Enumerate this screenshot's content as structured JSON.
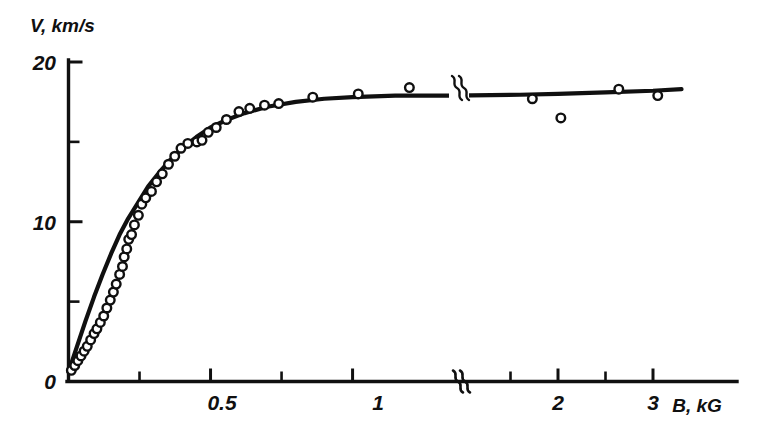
{
  "chart_data": {
    "type": "scatter",
    "title": "",
    "subtitle": "",
    "xlabel": "B, kG",
    "ylabel": "V, km/s",
    "xlabel_parts": {
      "symbol": "B",
      "unit": "kG"
    },
    "ylabel_parts": {
      "symbol": "V",
      "unit": "km/s"
    },
    "xlim": [
      0,
      3.35
    ],
    "ylim": [
      0,
      20.6
    ],
    "grid": false,
    "legend": null,
    "axis_break": {
      "present": true,
      "axis": "x",
      "at_value": 1.35,
      "symbol": "double-squiggle",
      "note": "x axis scale compresses after the break"
    },
    "x_ticks_major": [
      {
        "value": 0,
        "label": "0"
      },
      {
        "value": 0.5,
        "label": "0.5"
      },
      {
        "value": 1,
        "label": "1"
      },
      {
        "value": 2,
        "label": "2"
      },
      {
        "value": 3,
        "label": "3"
      }
    ],
    "x_ticks_minor": [
      0.25,
      0.75,
      1.5,
      2.5
    ],
    "y_ticks_major": [
      {
        "value": 0,
        "label": "0"
      },
      {
        "value": 10,
        "label": "10"
      },
      {
        "value": 20,
        "label": "20"
      }
    ],
    "y_ticks_minor": [
      5,
      15
    ],
    "series": [
      {
        "name": "measured points",
        "type": "scatter",
        "marker": "open-circle",
        "color": "#101010",
        "points": [
          [
            0.01,
            0.7
          ],
          [
            0.022,
            1.0
          ],
          [
            0.033,
            1.3
          ],
          [
            0.044,
            1.6
          ],
          [
            0.055,
            1.9
          ],
          [
            0.066,
            2.2
          ],
          [
            0.078,
            2.6
          ],
          [
            0.09,
            3.0
          ],
          [
            0.1,
            3.3
          ],
          [
            0.112,
            3.7
          ],
          [
            0.124,
            4.1
          ],
          [
            0.135,
            4.6
          ],
          [
            0.147,
            5.1
          ],
          [
            0.158,
            5.6
          ],
          [
            0.168,
            6.1
          ],
          [
            0.18,
            6.7
          ],
          [
            0.19,
            7.2
          ],
          [
            0.196,
            7.8
          ],
          [
            0.205,
            8.3
          ],
          [
            0.212,
            8.9
          ],
          [
            0.222,
            9.2
          ],
          [
            0.232,
            9.8
          ],
          [
            0.246,
            10.4
          ],
          [
            0.258,
            11.1
          ],
          [
            0.272,
            11.5
          ],
          [
            0.292,
            11.9
          ],
          [
            0.31,
            12.5
          ],
          [
            0.33,
            13.0
          ],
          [
            0.352,
            13.6
          ],
          [
            0.374,
            14.1
          ],
          [
            0.396,
            14.6
          ],
          [
            0.42,
            14.9
          ],
          [
            0.452,
            15.0
          ],
          [
            0.47,
            15.1
          ],
          [
            0.492,
            15.6
          ],
          [
            0.52,
            15.9
          ],
          [
            0.556,
            16.4
          ],
          [
            0.6,
            16.9
          ],
          [
            0.638,
            17.1
          ],
          [
            0.69,
            17.3
          ],
          [
            0.74,
            17.4
          ],
          [
            0.86,
            17.8
          ],
          [
            1.02,
            18.0
          ],
          [
            1.2,
            18.4
          ],
          [
            1.73,
            17.7
          ],
          [
            2.03,
            16.5
          ],
          [
            2.64,
            18.3
          ],
          [
            3.05,
            17.9
          ]
        ]
      },
      {
        "name": "theoretical curve",
        "type": "line",
        "color": "#101010",
        "points": [
          [
            0.0,
            0.6
          ],
          [
            0.03,
            2.2
          ],
          [
            0.06,
            3.8
          ],
          [
            0.09,
            5.3
          ],
          [
            0.12,
            6.7
          ],
          [
            0.15,
            8.0
          ],
          [
            0.18,
            9.2
          ],
          [
            0.21,
            10.2
          ],
          [
            0.245,
            11.2
          ],
          [
            0.28,
            12.2
          ],
          [
            0.32,
            13.1
          ],
          [
            0.36,
            13.9
          ],
          [
            0.4,
            14.6
          ],
          [
            0.45,
            15.3
          ],
          [
            0.5,
            15.9
          ],
          [
            0.56,
            16.4
          ],
          [
            0.62,
            16.8
          ],
          [
            0.7,
            17.2
          ],
          [
            0.8,
            17.5
          ],
          [
            0.9,
            17.7
          ],
          [
            1.0,
            17.8
          ],
          [
            1.15,
            17.9
          ],
          [
            1.35,
            17.9
          ],
          [
            1.6,
            17.95
          ],
          [
            2.0,
            18.0
          ],
          [
            2.5,
            18.1
          ],
          [
            3.0,
            18.2
          ],
          [
            3.3,
            18.3
          ]
        ]
      }
    ],
    "annotations": [
      {
        "name": "curve-break",
        "symbol": "double-squiggle",
        "x": 1.35,
        "y": 17.9
      }
    ]
  },
  "figure": {
    "background_color": "#ffffff",
    "ink_color": "#101010",
    "marker_style": "open circle, black outline, white fill"
  }
}
